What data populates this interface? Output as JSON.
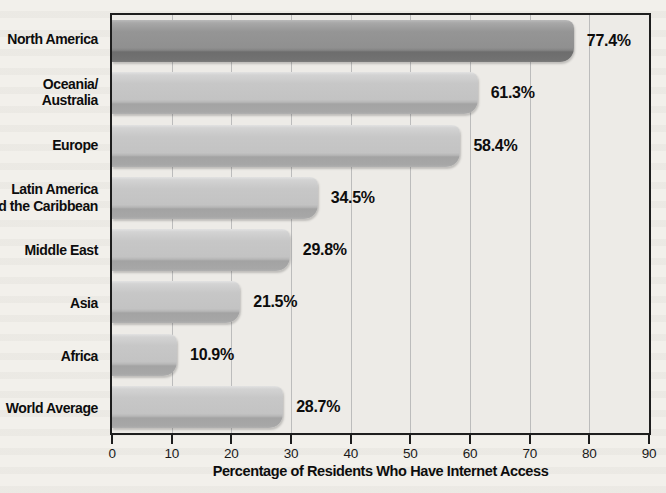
{
  "chart_data": {
    "type": "bar",
    "orientation": "horizontal",
    "title": "",
    "xlabel": "Percentage of Residents Who Have Internet Access",
    "ylabel": "",
    "xlim": [
      0,
      90
    ],
    "xticks": [
      "0",
      "10",
      "20",
      "30",
      "40",
      "50",
      "60",
      "70",
      "80",
      "90"
    ],
    "grid": "vertical gridlines at every tick",
    "legend": "none",
    "categories": [
      "North America",
      "Oceania/Australia",
      "Europe",
      "Latin America and the Caribbean",
      "Middle East",
      "Asia",
      "Africa",
      "World Average"
    ],
    "category_label_lines": [
      [
        "North America"
      ],
      [
        "Oceania/",
        "Australia"
      ],
      [
        "Europe"
      ],
      [
        "Latin America",
        "and the Caribbean"
      ],
      [
        "Middle East"
      ],
      [
        "Asia"
      ],
      [
        "Africa"
      ],
      [
        "World Average"
      ]
    ],
    "values": [
      77.4,
      61.3,
      58.4,
      34.5,
      29.8,
      21.5,
      10.9,
      28.7
    ],
    "value_labels": [
      "77.4%",
      "61.3%",
      "58.4%",
      "34.5%",
      "29.8%",
      "21.5%",
      "10.9%",
      "28.7%"
    ],
    "colors": {
      "bar_default": "#c3c3c3",
      "bar_north_america": "#909090",
      "bar_shadow": "#a3a3a3",
      "plot_background": "#edebe7",
      "page_background": "#f2f0eb",
      "gridline": "#bcbcbc",
      "border": "#1e1e1e",
      "text": "#0d0d0d"
    }
  }
}
